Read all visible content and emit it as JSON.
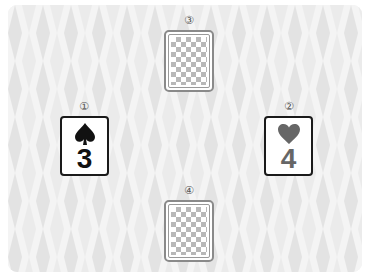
{
  "board": {
    "background_color": "#f1f1f1",
    "pattern": "harlequin-diamonds",
    "diamond_light": "#f4f4f4",
    "diamond_dark": "#e2e2e2"
  },
  "slots": [
    {
      "id": "slot-1",
      "label": "①",
      "position": "left",
      "card": {
        "state": "face-up",
        "suit": "spade",
        "suit_glyph": "♠",
        "rank": "3",
        "color": "#111111"
      }
    },
    {
      "id": "slot-2",
      "label": "②",
      "position": "right",
      "card": {
        "state": "face-up",
        "suit": "heart",
        "suit_glyph": "♥",
        "rank": "4",
        "color": "#666666"
      }
    },
    {
      "id": "slot-3",
      "label": "③",
      "position": "top",
      "card": {
        "state": "face-down",
        "back_pattern": "checkerboard"
      }
    },
    {
      "id": "slot-4",
      "label": "④",
      "position": "bottom",
      "card": {
        "state": "face-down",
        "back_pattern": "checkerboard"
      }
    }
  ]
}
